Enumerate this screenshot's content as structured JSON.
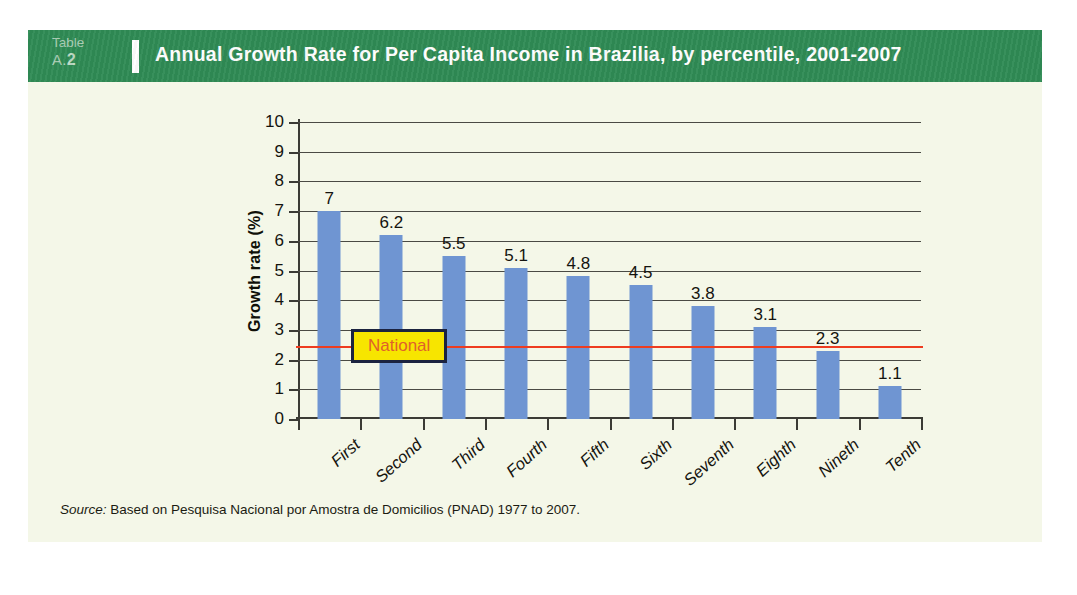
{
  "figure": {
    "table_tag_word": "Table",
    "table_tag_number_prefix": "A.",
    "table_tag_number": "2",
    "title": "Annual Growth Rate for Per Capita Income in Brazilia, by percentile, 2001-2007",
    "source_prefix": "Source:",
    "source_text": " Based on Pesquisa Nacional por Amostra de Domicilios (PNAD) 1977 to 2007.",
    "colors": {
      "header_green": "#2f8b55",
      "panel_cream": "#f4f7e8",
      "bar_blue": "#6f95d2",
      "reference_line_red": "#ee3c20",
      "callout_fill_yellow": "#f7e500",
      "callout_border_navy": "#1b2340",
      "callout_text_orange": "#e0602b",
      "axis_dark": "#3b3b35"
    }
  },
  "chart_data": {
    "type": "bar",
    "title": "Annual Growth Rate for Per Capita Income in Brazilia, by percentile, 2001-2007",
    "xlabel": "",
    "ylabel": "Growth rate (%)",
    "categories": [
      "First",
      "Second",
      "Third",
      "Fourth",
      "Fifth",
      "Sixth",
      "Seventh",
      "Eighth",
      "Nineth",
      "Tenth"
    ],
    "values": [
      7,
      6.2,
      5.5,
      5.1,
      4.8,
      4.5,
      3.8,
      3.1,
      2.3,
      1.1
    ],
    "value_labels": [
      "7",
      "6.2",
      "5.5",
      "5.1",
      "4.8",
      "4.5",
      "3.8",
      "3.1",
      "2.3",
      "1.1"
    ],
    "ylim": [
      0,
      10
    ],
    "yticks": [
      0,
      1,
      2,
      3,
      4,
      5,
      6,
      7,
      8,
      9,
      10
    ],
    "ytick_labels": [
      "0",
      "1",
      "2",
      "3",
      "4",
      "5",
      "6",
      "7",
      "8",
      "9",
      "10"
    ],
    "grid": true,
    "legend": false,
    "annotations": [
      {
        "name": "national-average",
        "label": "National",
        "type": "hline",
        "value": 2.45
      }
    ]
  }
}
